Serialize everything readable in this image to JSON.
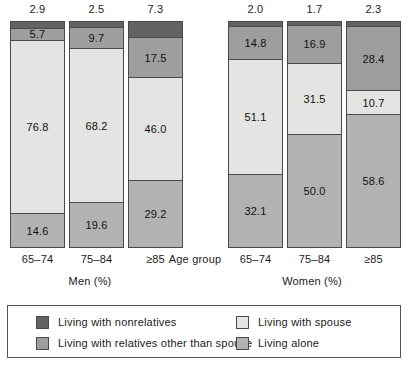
{
  "chart_data": {
    "type": "bar",
    "subtype": "stacked-bar-100",
    "title": "",
    "xlabel": "Age group",
    "ylabel": "",
    "ylim": [
      0,
      100
    ],
    "grid": false,
    "legend_position": "bottom",
    "panels": [
      {
        "name": "men",
        "title": "Men (%)",
        "categories": [
          "65–74",
          "75–84",
          "≥85"
        ]
      },
      {
        "name": "women",
        "title": "Women (%)",
        "categories": [
          "65–74",
          "75–84",
          "≥85"
        ]
      }
    ],
    "series": [
      {
        "name": "Living with nonrelatives",
        "key": "nonrelatives",
        "color": "#636363",
        "men": [
          2.9,
          2.5,
          7.3
        ],
        "women": [
          2.0,
          1.7,
          2.3
        ]
      },
      {
        "name": "Living with relatives other than spouse",
        "key": "relatives",
        "color": "#9e9e9e",
        "men": [
          5.7,
          9.7,
          17.5
        ],
        "women": [
          14.8,
          16.9,
          28.4
        ]
      },
      {
        "name": "Living with spouse",
        "key": "spouse",
        "color": "#e4e4e2",
        "men": [
          76.8,
          68.2,
          46.0
        ],
        "women": [
          51.1,
          31.5,
          10.7
        ]
      },
      {
        "name": "Living alone",
        "key": "alone",
        "color": "#b2b2b2",
        "men": [
          14.6,
          19.6,
          29.2
        ],
        "women": [
          32.1,
          50.0,
          58.6
        ]
      }
    ]
  },
  "axis": {
    "title": "Age group"
  },
  "panels": {
    "men": {
      "title": "Men (%)",
      "bars": [
        {
          "category": "65–74",
          "top_value": "2.9",
          "segments": [
            {
              "label": "",
              "value": 2.9,
              "fill": "nonrelatives"
            },
            {
              "label": "5.7",
              "value": 5.7,
              "fill": "relatives"
            },
            {
              "label": "76.8",
              "value": 76.8,
              "fill": "spouse"
            },
            {
              "label": "14.6",
              "value": 14.6,
              "fill": "alone"
            }
          ]
        },
        {
          "category": "75–84",
          "top_value": "2.5",
          "segments": [
            {
              "label": "",
              "value": 2.5,
              "fill": "nonrelatives"
            },
            {
              "label": "9.7",
              "value": 9.7,
              "fill": "relatives"
            },
            {
              "label": "68.2",
              "value": 68.2,
              "fill": "spouse"
            },
            {
              "label": "19.6",
              "value": 19.6,
              "fill": "alone"
            }
          ]
        },
        {
          "category": "≥85",
          "top_value": "7.3",
          "segments": [
            {
              "label": "",
              "value": 7.3,
              "fill": "nonrelatives"
            },
            {
              "label": "17.5",
              "value": 17.5,
              "fill": "relatives"
            },
            {
              "label": "46.0",
              "value": 46.0,
              "fill": "spouse"
            },
            {
              "label": "29.2",
              "value": 29.2,
              "fill": "alone"
            }
          ]
        }
      ]
    },
    "women": {
      "title": "Women (%)",
      "bars": [
        {
          "category": "65–74",
          "top_value": "2.0",
          "segments": [
            {
              "label": "",
              "value": 2.0,
              "fill": "nonrelatives"
            },
            {
              "label": "14.8",
              "value": 14.8,
              "fill": "relatives"
            },
            {
              "label": "51.1",
              "value": 51.1,
              "fill": "spouse"
            },
            {
              "label": "32.1",
              "value": 32.1,
              "fill": "alone"
            }
          ]
        },
        {
          "category": "75–84",
          "top_value": "1.7",
          "segments": [
            {
              "label": "",
              "value": 1.7,
              "fill": "nonrelatives"
            },
            {
              "label": "16.9",
              "value": 16.9,
              "fill": "relatives"
            },
            {
              "label": "31.5",
              "value": 31.5,
              "fill": "spouse"
            },
            {
              "label": "50.0",
              "value": 50.0,
              "fill": "alone"
            }
          ]
        },
        {
          "category": "≥85",
          "top_value": "2.3",
          "segments": [
            {
              "label": "",
              "value": 2.3,
              "fill": "nonrelatives"
            },
            {
              "label": "28.4",
              "value": 28.4,
              "fill": "relatives"
            },
            {
              "label": "10.7",
              "value": 10.7,
              "fill": "spouse"
            },
            {
              "label": "58.6",
              "value": 58.6,
              "fill": "alone"
            }
          ]
        }
      ]
    }
  },
  "legend": {
    "items": [
      {
        "label": "Living with nonrelatives",
        "fill": "nonrelatives",
        "color": "#636363"
      },
      {
        "label": "Living with relatives other than spouse",
        "fill": "relatives",
        "color": "#9e9e9e"
      },
      {
        "label": "Living with spouse",
        "fill": "spouse",
        "color": "#e4e4e2"
      },
      {
        "label": "Living alone",
        "fill": "alone",
        "color": "#b2b2b2"
      }
    ]
  }
}
